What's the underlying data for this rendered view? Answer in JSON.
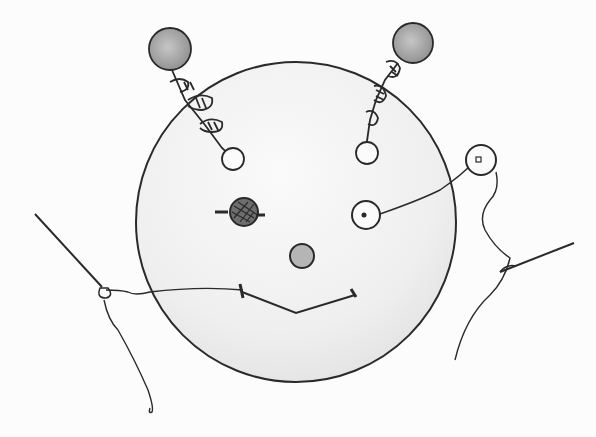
{
  "image": {
    "description": "Pencil sketch of a round face with button eyes, button nose, stitched smile, two antennae with wound thread ending in grey balls, and two sewing needles with threads",
    "colors": {
      "background": "#fcfcfc",
      "face_fill": "#efefef",
      "line": "#2a2a2a",
      "ball_fill": "#a9a9a9",
      "nose_fill": "#b5b5b5"
    }
  }
}
